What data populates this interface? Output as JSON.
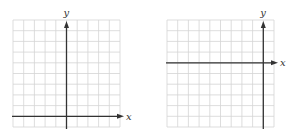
{
  "graphs": [
    {
      "id": "left",
      "x_label": "x",
      "y_label": "y",
      "grid": {
        "columns": 10,
        "rows": 10,
        "cell_px": 10.7,
        "origin_px": [
          13,
          20
        ]
      },
      "y_axis_column": 5,
      "x_axis_row": 9
    },
    {
      "id": "right",
      "x_label": "x",
      "y_label": "y",
      "grid": {
        "columns": 10,
        "rows": 10,
        "cell_px": 10.7,
        "origin_px": [
          167,
          20
        ]
      },
      "y_axis_column": 9,
      "x_axis_row": 4
    }
  ],
  "colors": {
    "grid": "#d4d4d4",
    "axis": "#333333",
    "background": "#ffffff"
  }
}
